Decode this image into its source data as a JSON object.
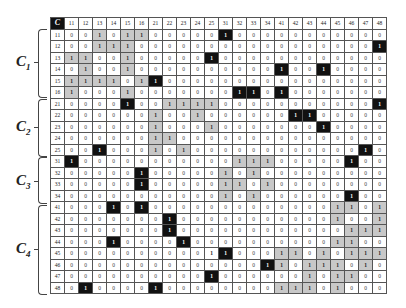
{
  "matrix": {
    "corner_label": "C",
    "columns": [
      "11",
      "12",
      "13",
      "14",
      "15",
      "16",
      "21",
      "22",
      "23",
      "24",
      "25",
      "31",
      "32",
      "33",
      "34",
      "41",
      "42",
      "43",
      "44",
      "45",
      "46",
      "47",
      "48"
    ],
    "legend": {
      "0": "zero",
      "g": "1 (gray, within-cluster)",
      "b": "1 (black, off-cluster)",
      "p": "1 (plain)"
    },
    "rows": [
      {
        "label": "11",
        "cells": "0 0 g 0 g g 0 0 0 0 0 b 0 0 0 0 0 0 0 0 0 0 0"
      },
      {
        "label": "12",
        "cells": "0 0 g g g 0 0 0 0 0 0 0 0 0 0 0 0 0 0 0 0 0 b"
      },
      {
        "label": "13",
        "cells": "g g 0 0 g 0 0 0 0 0 b 0 0 0 0 0 0 0 0 0 0 0 0"
      },
      {
        "label": "14",
        "cells": "0 g 0 0 g 0 0 0 0 0 0 0 0 0 0 b 0 0 b 0 0 0 0"
      },
      {
        "label": "15",
        "cells": "g g g g 0 g b 0 0 0 0 0 0 0 0 0 0 0 0 0 0 0 0"
      },
      {
        "label": "16",
        "cells": "g 0 0 0 g 0 0 0 0 0 0 0 b b 0 b 0 0 0 0 0 0 0"
      },
      {
        "label": "21",
        "cells": "0 0 0 0 b 0 0 g g g g 0 0 0 0 0 0 0 0 0 0 0 b"
      },
      {
        "label": "22",
        "cells": "0 0 0 0 0 0 g 0 0 g 0 0 0 0 0 0 b b 0 0 0 0 0"
      },
      {
        "label": "23",
        "cells": "0 0 0 0 0 0 g 0 0 0 g 0 0 0 0 0 0 0 b 0 0 0 0"
      },
      {
        "label": "24",
        "cells": "0 0 0 0 0 0 g g 0 0 0 0 0 0 0 0 0 0 0 0 0 0 0"
      },
      {
        "label": "25",
        "cells": "0 0 b 0 0 0 g 0 g 0 0 0 0 0 0 0 0 0 0 0 0 b 0"
      },
      {
        "label": "31",
        "cells": "b 0 0 0 0 0 0 0 0 0 0 0 g g g 0 0 0 0 0 b 0 0"
      },
      {
        "label": "32",
        "cells": "0 0 0 0 0 b 0 0 0 0 0 g 0 g 0 0 0 0 0 0 0 0 0"
      },
      {
        "label": "33",
        "cells": "0 0 0 0 0 b 0 0 0 0 0 g g 0 g 0 0 0 0 0 0 0 0"
      },
      {
        "label": "34",
        "cells": "0 0 0 0 0 0 0 0 0 0 0 g 0 g 0 0 0 0 0 0 b 0 0"
      },
      {
        "label": "41",
        "cells": "0 0 0 b 0 b 0 0 0 0 0 0 0 0 0 0 0 0 0 g g 0 g"
      },
      {
        "label": "42",
        "cells": "0 0 0 0 0 0 0 b 0 0 0 0 0 0 0 0 0 0 0 g 0 0 g"
      },
      {
        "label": "43",
        "cells": "0 0 0 0 0 0 0 b 0 0 0 0 0 0 0 0 0 0 0 0 g g g"
      },
      {
        "label": "44",
        "cells": "0 0 0 b 0 0 0 0 b 0 0 0 0 0 0 0 0 0 0 g g 0 0"
      },
      {
        "label": "45",
        "cells": "0 0 0 0 0 0 0 0 0 0 p b 0 0 0 g g 0 g 0 g g g"
      },
      {
        "label": "46",
        "cells": "0 0 0 0 0 0 0 0 0 0 0 0 0 0 b g 0 g g g 0 g 0"
      },
      {
        "label": "47",
        "cells": "0 0 0 0 0 0 0 0 0 0 b 0 0 0 0 0 0 g 0 g g 0 0"
      },
      {
        "label": "48",
        "cells": "0 b 0 0 0 0 b 0 0 0 0 0 0 0 0 g g g 0 g 0 0 0"
      }
    ]
  },
  "clusters": [
    {
      "label": "C",
      "sub": "1",
      "rows": "11-16"
    },
    {
      "label": "C",
      "sub": "2",
      "rows": "21-25"
    },
    {
      "label": "C",
      "sub": "3",
      "rows": "31-34"
    },
    {
      "label": "C",
      "sub": "4",
      "rows": "41-48"
    }
  ]
}
